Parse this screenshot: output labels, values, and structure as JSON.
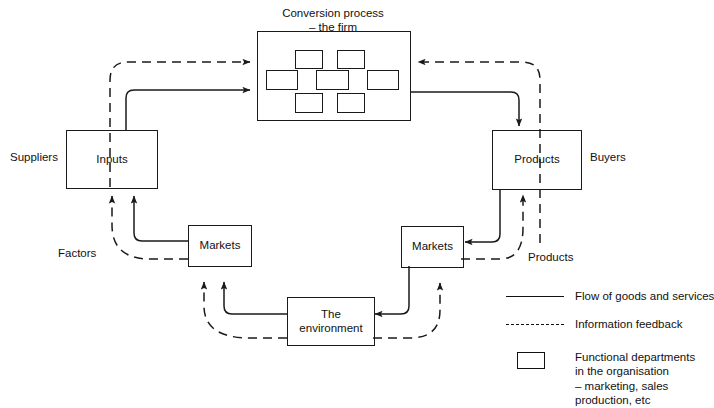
{
  "diagram": {
    "title_firm": "Conversion process\n– the firm",
    "nodes": {
      "inputs": "Inputs",
      "products": "Products",
      "markets_left": "Markets",
      "markets_right": "Markets",
      "environment": "The\nenvironment"
    },
    "labels": {
      "suppliers": "Suppliers",
      "buyers": "Buyers",
      "factors": "Factors",
      "products_feedback": "Products"
    }
  },
  "legend": {
    "items": [
      {
        "symbol": "solid-line",
        "label": "Flow of goods and services"
      },
      {
        "symbol": "dashed-line",
        "label": "Information feedback"
      },
      {
        "symbol": "box",
        "label": "Functional departments\nin the organisation\n– marketing, sales\nproduction, etc"
      }
    ]
  },
  "colors": {
    "stroke": "#1a1a1a",
    "text": "#111111",
    "background": "#ffffff"
  }
}
